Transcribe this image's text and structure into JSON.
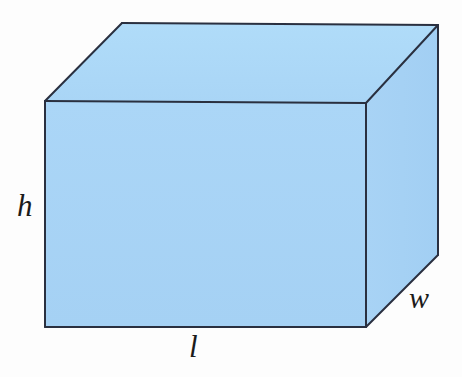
{
  "figure": {
    "kind": "geometry-diagram",
    "shape_name": "rectangular-prism",
    "background_color": "#fdfdfd",
    "canvas": {
      "width": 462,
      "height": 377
    }
  },
  "solid": {
    "face_fill_color": "#a8d4f5",
    "top_face_fill_color": "#addaf8",
    "right_face_fill_color": "#a5d2f4",
    "edge_color": "#2a3040",
    "edge_width": 2,
    "vertices": {
      "front_top_left": {
        "x": 45,
        "y": 101
      },
      "front_top_right": {
        "x": 366,
        "y": 103
      },
      "front_bottom_right": {
        "x": 366,
        "y": 327
      },
      "front_bottom_left": {
        "x": 45,
        "y": 327
      },
      "back_top_left": {
        "x": 122,
        "y": 23
      },
      "back_top_right": {
        "x": 438,
        "y": 25
      },
      "back_bottom_right": {
        "x": 438,
        "y": 255
      }
    },
    "faces": [
      {
        "name": "front-face",
        "points": "45,101 366,103 366,327 45,327"
      },
      {
        "name": "top-face",
        "points": "45,101 122,23 438,25 366,103"
      },
      {
        "name": "right-face",
        "points": "366,103 438,25 438,255 366,327"
      }
    ]
  },
  "labels": {
    "height": {
      "text": "h",
      "meaning": "height",
      "x": 20,
      "y": 207
    },
    "length": {
      "text": "l",
      "meaning": "length",
      "x": 196,
      "y": 348
    },
    "width": {
      "text": "w",
      "meaning": "width",
      "x": 422,
      "y": 299
    }
  }
}
